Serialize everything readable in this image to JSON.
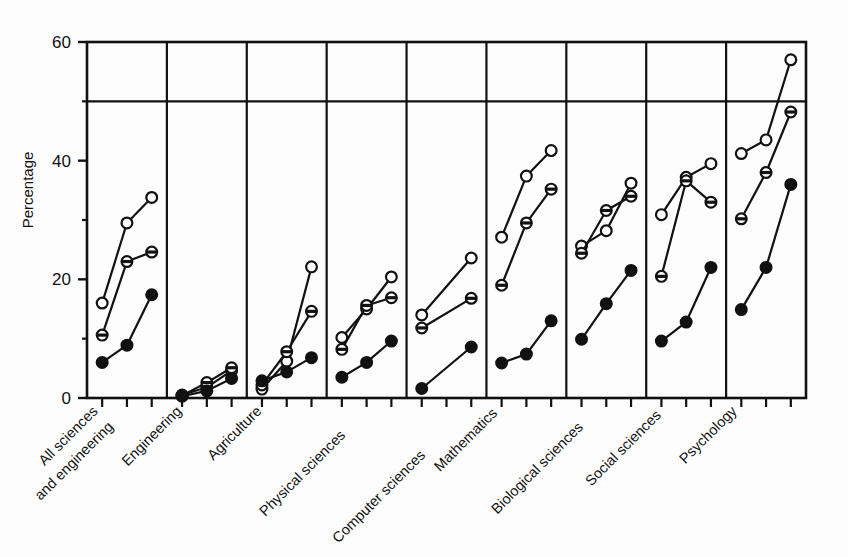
{
  "chart_data": {
    "type": "line",
    "title": "",
    "xlabel": "",
    "ylabel": "Percentage",
    "ylim": [
      0,
      60
    ],
    "yticks": [
      0,
      20,
      40,
      60
    ],
    "yticks_minor": [
      10,
      30,
      50
    ],
    "grid": false,
    "legend_position": "none",
    "reference_line": {
      "y": 50,
      "style": "solid",
      "label": ""
    },
    "panel_separators": true,
    "categories": [
      "All sciences and engineering",
      "Engineering",
      "Agriculture",
      "Physical sciences",
      "Computer sciences",
      "Mathematics",
      "Biological sciences",
      "Social sciences",
      "Psychology"
    ],
    "series": [
      {
        "name": "open-circle",
        "marker": "open circle",
        "values": [
          [
            16.0,
            29.5,
            33.8
          ],
          [
            0.5,
            1.8,
            4.6
          ],
          [
            1.5,
            6.2,
            22.1
          ],
          [
            10.2,
            15.0,
            20.4
          ],
          [
            14.0,
            23.6
          ],
          [
            27.1,
            37.4,
            41.7
          ],
          [
            25.6,
            28.2,
            36.2
          ],
          [
            30.9,
            37.2,
            39.5
          ],
          [
            41.2,
            43.5,
            57.0
          ]
        ]
      },
      {
        "name": "half-filled-circle",
        "marker": "half filled circle",
        "values": [
          [
            10.6,
            23.0,
            24.6
          ],
          [
            0.4,
            2.6,
            5.1
          ],
          [
            2.2,
            7.8,
            14.6
          ],
          [
            8.2,
            15.6,
            16.9
          ],
          [
            11.8,
            16.8
          ],
          [
            19.0,
            29.5,
            35.2
          ],
          [
            24.4,
            31.6,
            34.0
          ],
          [
            20.5,
            36.6,
            33.0
          ],
          [
            30.2,
            38.0,
            48.2
          ]
        ]
      },
      {
        "name": "filled-circle",
        "marker": "filled circle",
        "values": [
          [
            6.0,
            8.9,
            17.4
          ],
          [
            0.3,
            1.2,
            3.3
          ],
          [
            2.9,
            4.4,
            6.8
          ],
          [
            3.5,
            6.0,
            9.6
          ],
          [
            1.6,
            8.6
          ],
          [
            5.9,
            7.4,
            13.0
          ],
          [
            9.9,
            15.9,
            21.5
          ],
          [
            9.6,
            12.8,
            22.0
          ],
          [
            14.9,
            22.0,
            36.0
          ]
        ]
      }
    ]
  },
  "axes": {
    "y_title": "Percentage",
    "y_tick_labels": [
      "60",
      "40",
      "20",
      "0"
    ]
  },
  "colors": {
    "foreground": "#111111",
    "background": "#fdfdfd",
    "marker_fill_open": "#ffffff",
    "marker_fill_closed": "#111111"
  }
}
